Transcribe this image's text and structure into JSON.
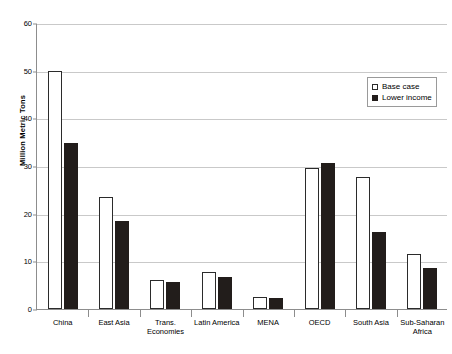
{
  "chart_data": {
    "type": "bar",
    "title": "",
    "xlabel": "",
    "ylabel": "Million Metric Tons",
    "ylim": [
      0,
      60
    ],
    "yticks": [
      0,
      10,
      20,
      30,
      40,
      50,
      60
    ],
    "grid": true,
    "legend_position": "top-right",
    "categories": [
      "China",
      "East Asia",
      "Trans.\nEconomies",
      "Latin America",
      "MENA",
      "OECD",
      "South Asia",
      "Sub-Saharan\nAfrica"
    ],
    "series": [
      {
        "name": "Base case",
        "color": "#ffffff",
        "values": [
          50.0,
          23.4,
          6.1,
          7.8,
          2.5,
          29.5,
          27.7,
          11.5
        ]
      },
      {
        "name": "Lower income",
        "color": "#221d1b",
        "values": [
          34.8,
          18.4,
          5.6,
          6.8,
          2.3,
          30.7,
          16.2,
          8.7
        ]
      }
    ]
  },
  "legend": {
    "items": [
      {
        "label": "Base case",
        "swatch": "hollow-square-icon"
      },
      {
        "label": "Lower income",
        "swatch": "filled-square-icon"
      }
    ]
  }
}
